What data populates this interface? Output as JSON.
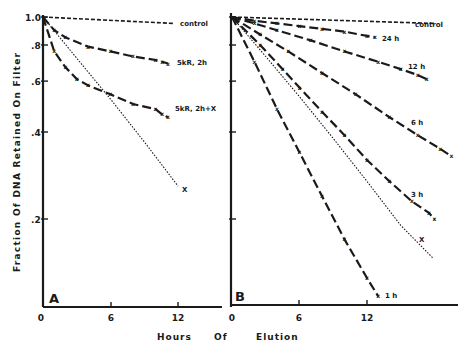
{
  "colors": {
    "ink": "#1a1a1a",
    "background": "#ffffff"
  },
  "chart_data": [
    {
      "type": "line",
      "panel": "A",
      "title": "",
      "xlabel": "Hours Of Elution",
      "ylabel": "Fraction Of DNA Retained On Filter",
      "yscale": "log",
      "ylim": [
        0.1,
        1.0
      ],
      "xlim": [
        0,
        16
      ],
      "xticks": [
        0,
        6,
        12
      ],
      "yticks": [
        1.0,
        0.8,
        0.6,
        0.4,
        0.2
      ],
      "ytick_labels": [
        "1.0",
        ".8",
        ".6",
        ".4",
        ".2"
      ],
      "grid": false,
      "legend": "inline labels at line ends",
      "series": [
        {
          "name": "control",
          "style": "dashed",
          "x": [
            0,
            11.6
          ],
          "y": [
            1.0,
            0.95
          ]
        },
        {
          "name": "5kR, 2h",
          "style": "dash-x",
          "x": [
            0,
            1,
            2,
            4,
            6,
            8,
            10,
            10.6,
            11.1
          ],
          "y": [
            1.0,
            0.9,
            0.85,
            0.79,
            0.76,
            0.73,
            0.71,
            0.7,
            0.69
          ]
        },
        {
          "name": "5kR, 2h+X",
          "style": "dash-x",
          "x": [
            0,
            1,
            2,
            3,
            4,
            6,
            8,
            10,
            10.6,
            11.1
          ],
          "y": [
            1.0,
            0.76,
            0.67,
            0.61,
            0.58,
            0.54,
            0.5,
            0.48,
            0.46,
            0.45
          ]
        },
        {
          "name": "X",
          "style": "dotted",
          "x": [
            0,
            3,
            6,
            9,
            12
          ],
          "y": [
            1.0,
            0.72,
            0.52,
            0.37,
            0.26
          ]
        }
      ]
    },
    {
      "type": "line",
      "panel": "B",
      "title": "",
      "xlabel": "Hours Of Elution",
      "ylabel": "Fraction Of DNA Retained On Filter",
      "yscale": "log",
      "ylim": [
        0.1,
        1.0
      ],
      "xlim": [
        0,
        20
      ],
      "xticks": [
        0,
        6,
        12
      ],
      "grid": false,
      "legend": "inline labels at line ends",
      "series": [
        {
          "name": "control",
          "style": "dashed",
          "x": [
            0,
            18
          ],
          "y": [
            1.0,
            0.95
          ]
        },
        {
          "name": "24 h",
          "style": "dash-x",
          "x": [
            0,
            2,
            4,
            6,
            8,
            10,
            12,
            12.7
          ],
          "y": [
            1.0,
            0.97,
            0.95,
            0.93,
            0.91,
            0.89,
            0.86,
            0.85
          ]
        },
        {
          "name": "12 h",
          "style": "dash-x",
          "x": [
            0,
            2,
            4,
            7,
            10,
            13,
            15,
            16.5,
            17.3
          ],
          "y": [
            1.0,
            0.95,
            0.9,
            0.83,
            0.76,
            0.7,
            0.66,
            0.63,
            0.61
          ]
        },
        {
          "name": "6 h",
          "style": "dash-x",
          "x": [
            0,
            2.5,
            5,
            8,
            11,
            14,
            16.5,
            18.5,
            19.5
          ],
          "y": [
            1.0,
            0.87,
            0.76,
            0.64,
            0.54,
            0.45,
            0.39,
            0.35,
            0.33
          ]
        },
        {
          "name": "3 h",
          "style": "dash-x",
          "x": [
            0,
            2.5,
            4.5,
            6,
            8,
            10,
            12,
            14,
            16,
            17.5,
            18
          ],
          "y": [
            1.0,
            0.8,
            0.66,
            0.57,
            0.47,
            0.39,
            0.32,
            0.27,
            0.23,
            0.21,
            0.2
          ]
        },
        {
          "name": "X",
          "style": "dotted",
          "x": [
            0,
            3,
            6,
            9,
            12,
            15,
            17.9
          ],
          "y": [
            1.0,
            0.73,
            0.53,
            0.38,
            0.27,
            0.19,
            0.146
          ]
        },
        {
          "name": "1 h",
          "style": "dash-x",
          "x": [
            0,
            2,
            4,
            6,
            8,
            10,
            12,
            13
          ],
          "y": [
            1.0,
            0.7,
            0.48,
            0.34,
            0.24,
            0.17,
            0.125,
            0.108
          ]
        }
      ]
    }
  ],
  "labels": {
    "y_axis_title": "Fraction Of DNA Retained On Filter",
    "x_axis_title_parts": [
      "Hours",
      "Of",
      "Elution"
    ],
    "panel_a": "A",
    "panel_b": "B",
    "ytick": [
      "1.0",
      ".8",
      ".6",
      ".4",
      ".2"
    ],
    "xtick_a": [
      "0",
      "6",
      "12"
    ],
    "xtick_b": [
      "0",
      "6",
      "12"
    ],
    "a_series": [
      "control",
      "5kR, 2h",
      "5kR, 2h+X",
      "X"
    ],
    "b_series": [
      "control",
      "24 h",
      "12 h",
      "6 h",
      "3 h",
      "X",
      "1 h"
    ]
  }
}
